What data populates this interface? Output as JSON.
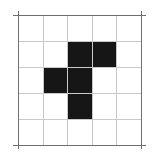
{
  "figure": {
    "title": "Pentomino on 5 by 5 grid",
    "description": "Five filled black square cells arranged in an F-pentomino shape on a light gray 5 by 5 grid with a darker outer frame.",
    "background_color": "#ffffff"
  },
  "grid": {
    "columns": 5,
    "rows": 5,
    "cell_size_px": 24.6,
    "origin_x_px": 18,
    "origin_y_px": 15,
    "width_px": 123,
    "height_px": 130,
    "line_color": "#c9c9c9",
    "frame_color": "#6f6f6f",
    "line_width_px": 1,
    "column_positions_px": [
      0,
      24.6,
      49.2,
      73.8,
      98.4,
      123
    ],
    "row_positions_px": [
      0,
      26,
      52,
      78,
      104,
      130
    ]
  },
  "shape": {
    "name": "f-pentomino",
    "fill_color": "#161616",
    "cell_count": 5,
    "filled_cells": [
      {
        "row": 1,
        "col": 2
      },
      {
        "row": 1,
        "col": 3
      },
      {
        "row": 2,
        "col": 1
      },
      {
        "row": 2,
        "col": 2
      },
      {
        "row": 3,
        "col": 2
      }
    ]
  },
  "chart_data": {
    "type": "heatmap",
    "title": "Pentomino on 5 by 5 grid",
    "xlabel": "",
    "ylabel": "",
    "categories": [
      "0",
      "1",
      "2",
      "3",
      "4"
    ],
    "row_labels": [
      "0",
      "1",
      "2",
      "3",
      "4"
    ],
    "grid": true,
    "legend": "none",
    "values": [
      [
        0,
        0,
        0,
        0,
        0
      ],
      [
        0,
        0,
        1,
        1,
        0
      ],
      [
        0,
        1,
        1,
        0,
        0
      ],
      [
        0,
        0,
        1,
        0,
        0
      ],
      [
        0,
        0,
        0,
        0,
        0
      ]
    ]
  }
}
